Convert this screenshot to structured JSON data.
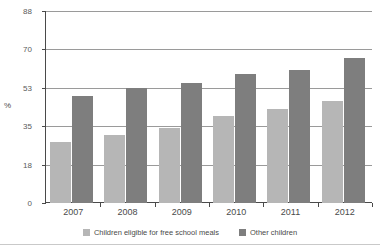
{
  "chart_data": {
    "type": "bar",
    "title": "",
    "xlabel": "",
    "ylabel": "%",
    "ylim": [
      0,
      88
    ],
    "yticks": [
      0,
      18,
      35,
      53,
      70,
      88
    ],
    "ytick_labels": [
      "0",
      "18",
      "35",
      "53",
      "70",
      "88"
    ],
    "grid": true,
    "legend_position": "bottom",
    "categories": [
      "2007",
      "2008",
      "2009",
      "2010",
      "2011",
      "2012"
    ],
    "series": [
      {
        "name": "Children eligible for free school meals",
        "color": "#b6b6b6",
        "values": [
          28,
          31,
          34,
          40,
          43,
          47
        ]
      },
      {
        "name": "Other children",
        "color": "#7e7e7e",
        "values": [
          49,
          53,
          55,
          59,
          61,
          66
        ]
      }
    ]
  },
  "axes": {
    "y_unit_label": "%"
  },
  "legend": {
    "items": [
      {
        "label": "Children eligible for free school meals",
        "swatch": "legend-swatch-fsm"
      },
      {
        "label": "Other children",
        "swatch": "legend-swatch-other"
      }
    ]
  }
}
